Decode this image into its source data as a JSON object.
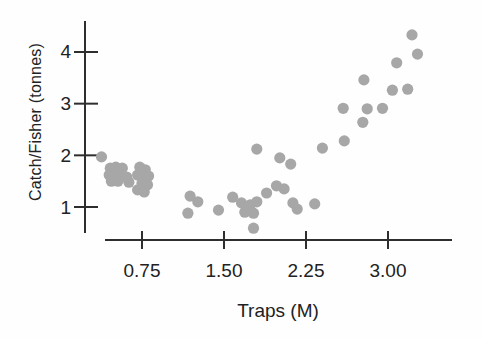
{
  "figure": {
    "kind": "scanned textbook scatterplot",
    "background_color": "#fefefe"
  },
  "chart_data": {
    "type": "scatter",
    "title": "",
    "xlabel": "Traps (M)",
    "ylabel": "Catch/Fisher (tonnes)",
    "x_tick_values": [
      0.75,
      1.5,
      2.25,
      3.0
    ],
    "x_tick_labels": [
      "0.75",
      "1.50",
      "2.25",
      "3.00"
    ],
    "y_tick_values": [
      1,
      2,
      3,
      4
    ],
    "y_tick_labels": [
      "1",
      "2",
      "3",
      "4"
    ],
    "xlim": [
      0.4,
      3.6
    ],
    "ylim": [
      0.5,
      4.6
    ],
    "grid": false,
    "legend": null,
    "axis_color": "#2e2e2e",
    "marker": {
      "shape": "circle",
      "radius_px": 5.6,
      "color": "#a7a7a7"
    },
    "points": [
      [
        0.38,
        1.97
      ],
      [
        0.46,
        1.75
      ],
      [
        0.51,
        1.77
      ],
      [
        0.57,
        1.75
      ],
      [
        0.45,
        1.62
      ],
      [
        0.5,
        1.64
      ],
      [
        0.56,
        1.62
      ],
      [
        0.61,
        1.58
      ],
      [
        0.47,
        1.5
      ],
      [
        0.53,
        1.5
      ],
      [
        0.63,
        1.48
      ],
      [
        0.73,
        1.77
      ],
      [
        0.78,
        1.72
      ],
      [
        0.71,
        1.62
      ],
      [
        0.77,
        1.58
      ],
      [
        0.81,
        1.6
      ],
      [
        0.75,
        1.46
      ],
      [
        0.8,
        1.43
      ],
      [
        0.71,
        1.33
      ],
      [
        0.77,
        1.29
      ],
      [
        1.19,
        1.21
      ],
      [
        1.26,
        1.1
      ],
      [
        1.17,
        0.88
      ],
      [
        1.45,
        0.94
      ],
      [
        1.58,
        1.19
      ],
      [
        1.8,
        2.12
      ],
      [
        2.01,
        1.95
      ],
      [
        2.11,
        1.83
      ],
      [
        1.98,
        1.41
      ],
      [
        2.05,
        1.35
      ],
      [
        1.89,
        1.27
      ],
      [
        1.66,
        1.08
      ],
      [
        1.74,
        1.04
      ],
      [
        1.8,
        1.1
      ],
      [
        1.69,
        0.9
      ],
      [
        1.77,
        0.88
      ],
      [
        1.77,
        0.59
      ],
      [
        2.13,
        1.08
      ],
      [
        2.17,
        0.96
      ],
      [
        2.33,
        1.06
      ],
      [
        2.4,
        2.14
      ],
      [
        2.6,
        2.28
      ],
      [
        2.77,
        2.64
      ],
      [
        2.59,
        2.91
      ],
      [
        2.81,
        2.9
      ],
      [
        2.95,
        2.91
      ],
      [
        2.78,
        3.46
      ],
      [
        3.04,
        3.26
      ],
      [
        3.18,
        3.28
      ],
      [
        3.08,
        3.79
      ],
      [
        3.22,
        4.33
      ],
      [
        3.27,
        3.96
      ]
    ]
  }
}
